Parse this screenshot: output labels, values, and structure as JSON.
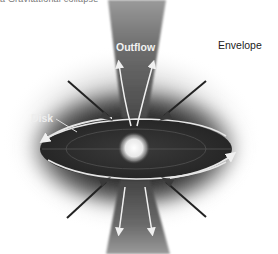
{
  "figure": {
    "caption_partial": "a  Gravitational collapse",
    "labels": {
      "outflow": "Outflow",
      "envelope": "Envelope",
      "disk": "Disk"
    },
    "components": [
      {
        "name": "envelope",
        "description": "dark gray diffuse envelope surrounding system"
      },
      {
        "name": "disk",
        "description": "flattened rotating disk (ellipse) with rotation arrows"
      },
      {
        "name": "protostar",
        "description": "bright central glowing star"
      },
      {
        "name": "outflow",
        "description": "bipolar outflow cones, up and down, with white arrows"
      },
      {
        "name": "infall",
        "description": "four diagonal dark infall arrows onto disk"
      }
    ],
    "colors": {
      "background": "#ffffff",
      "envelope": "#3a3a3a",
      "outflow_cone": "#6a6a6a",
      "disk_edge": "#e8e8e8",
      "star": "#f4f4f4",
      "infall_arrow": "#2a2a2a"
    }
  }
}
